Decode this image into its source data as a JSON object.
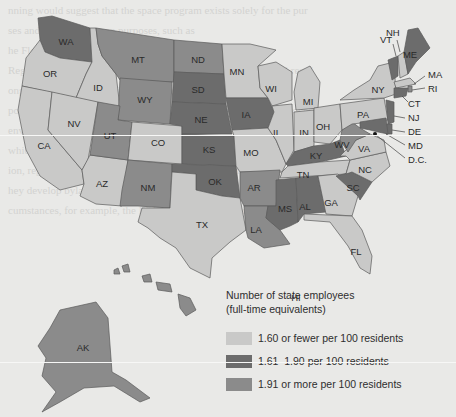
{
  "map": {
    "type": "choropleth",
    "title": "Number of state employees (full-time equivalents)",
    "legend": {
      "title_line1": "Number of state employees",
      "title_line2": "(full-time equivalents)",
      "items": [
        {
          "label": "1.60 or fewer per 100 residents",
          "color": "#c9c9c8",
          "class": "light"
        },
        {
          "label": "1.61–1.90 per 100 residents",
          "color": "#6c6c6c",
          "class": "dark"
        },
        {
          "label": "1.91 or more per 100 residents",
          "color": "#8b8b8b",
          "class": "med"
        }
      ]
    },
    "states": {
      "WA": "1.61–1.90",
      "OR": "1.60 or fewer",
      "CA": "1.60 or fewer",
      "ID": "1.60 or fewer",
      "NV": "1.60 or fewer",
      "AZ": "1.60 or fewer",
      "MT": "1.91 or more",
      "WY": "1.91 or more",
      "UT": "1.91 or more",
      "CO": "1.60 or fewer",
      "NM": "1.91 or more",
      "ND": "1.91 or more",
      "SD": "1.61–1.90",
      "NE": "1.61–1.90",
      "KS": "1.61–1.90",
      "OK": "1.61–1.90",
      "TX": "1.60 or fewer",
      "MN": "1.60 or fewer",
      "IA": "1.61–1.90",
      "MO": "1.60 or fewer",
      "AR": "1.91 or more",
      "LA": "1.91 or more",
      "WI": "1.60 or fewer",
      "IL": "1.60 or fewer",
      "MI": "1.60 or fewer",
      "IN": "1.60 or fewer",
      "OH": "1.60 or fewer",
      "KY": "1.61–1.90",
      "TN": "1.60 or fewer",
      "MS": "1.61–1.90",
      "AL": "1.61–1.90",
      "GA": "1.60 or fewer",
      "FL": "1.60 or fewer",
      "SC": "1.61–1.90",
      "NC": "1.60 or fewer",
      "VA": "1.60 or fewer",
      "WV": "1.91 or more",
      "PA": "1.60 or fewer",
      "NY": "1.60 or fewer",
      "VT": "1.61–1.90",
      "NH": "1.60 or fewer",
      "ME": "1.61–1.90",
      "MA": "1.60 or fewer",
      "RI": "1.91 or more",
      "CT": "1.61–1.90",
      "NJ": "1.61–1.90",
      "DE": "1.61–1.90",
      "MD": "1.61–1.90",
      "D.C.": "",
      "AK": "1.91 or more",
      "HI": "1.91 or more"
    },
    "labels": {
      "WA": "WA",
      "OR": "OR",
      "CA": "CA",
      "ID": "ID",
      "NV": "NV",
      "AZ": "AZ",
      "MT": "MT",
      "WY": "WY",
      "UT": "UT",
      "CO": "CO",
      "NM": "NM",
      "ND": "ND",
      "SD": "SD",
      "NE": "NE",
      "KS": "KS",
      "OK": "OK",
      "TX": "TX",
      "MN": "MN",
      "IA": "IA",
      "MO": "MO",
      "AR": "AR",
      "LA": "LA",
      "WI": "WI",
      "IL": "IL",
      "MI": "MI",
      "IN": "IN",
      "OH": "OH",
      "KY": "KY",
      "TN": "TN",
      "MS": "MS",
      "AL": "AL",
      "GA": "GA",
      "FL": "FL",
      "SC": "SC",
      "NC": "NC",
      "VA": "VA",
      "WV": "WV",
      "PA": "PA",
      "NY": "NY",
      "VT": "VT",
      "NH": "NH",
      "ME": "ME",
      "MA": "MA",
      "RI": "RI",
      "CT": "CT",
      "NJ": "NJ",
      "DE": "DE",
      "MD": "MD",
      "DC": "D.C.",
      "AK": "AK",
      "HI": "HI"
    }
  },
  "background_text": [
    "nning would suggest that the space program exists solely for the pur",
    "ses and relies on its own purposes, such as",
    "",
    "",
    "",
    "",
    "",
    "",
    "",
    "",
    "",
    "",
    "he Florida",
    "Regulatory agencies are those that oversee and enforce a partial regul",
    "ongoing regulatory activity. Examples of these are the state's",
    "ponsible for the environment (sometimes called an EPA), which oversees",
    "environmental Protection Agency (EPA), a federal agency",
    "which regulations and enforcement policies; more administrative funct",
    "ion, regulatory agencies have a general function of making and",
    "hey develop bylaws, regulations, and meet a judicial function",
    "cumstances, for example, the EPA for example, can order that fines",
    "he state parties who violate environmental regulations.",
    "Government corporations are entities that provide a service and",
    "harge for their services, and are governed by a board",
    "charge for the services provided, by a board of directors"
  ]
}
